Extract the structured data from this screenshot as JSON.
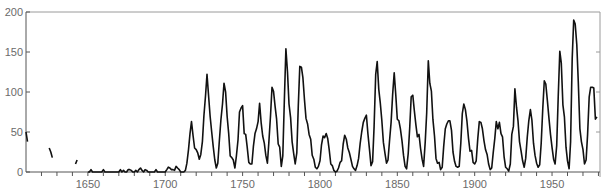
{
  "chart_data": {
    "type": "line",
    "title": "",
    "xlabel": "",
    "ylabel": "",
    "xlim": [
      1610,
      1981
    ],
    "ylim": [
      0,
      200
    ],
    "grid": false,
    "legend": null,
    "x_ticks": [
      1650,
      1700,
      1750,
      1800,
      1850,
      1900,
      1950
    ],
    "y_ticks": [
      0,
      50,
      100,
      150,
      200
    ],
    "series": [
      {
        "name": "Annual sunspot number",
        "segments": [
          {
            "x": [
              1610,
              1611
            ],
            "values": [
              50,
              38
            ]
          },
          {
            "x": [
              1625,
              1626,
              1627
            ],
            "values": [
              30,
              25,
              18
            ]
          },
          {
            "x": [
              1642,
              1643
            ],
            "values": [
              10,
              15
            ]
          },
          {
            "x": [
              1650,
              1651,
              1652,
              1653,
              1654,
              1655,
              1656,
              1657,
              1658,
              1659,
              1660,
              1661,
              1662,
              1663,
              1664,
              1665,
              1666,
              1667,
              1668,
              1669,
              1670,
              1671,
              1672,
              1673,
              1674,
              1675,
              1676,
              1677,
              1678,
              1679,
              1680,
              1681,
              1682,
              1683,
              1684,
              1685,
              1686,
              1687,
              1688,
              1689,
              1690,
              1691,
              1692,
              1693,
              1694,
              1695,
              1696,
              1697,
              1698,
              1699,
              1700,
              1701,
              1702,
              1703,
              1704,
              1705,
              1706,
              1707,
              1708,
              1709,
              1710,
              1711,
              1712,
              1713,
              1714,
              1715,
              1716,
              1717,
              1718,
              1719,
              1720,
              1721,
              1722,
              1723,
              1724,
              1725,
              1726,
              1727,
              1728,
              1729,
              1730,
              1731,
              1732,
              1733,
              1734,
              1735,
              1736,
              1737,
              1738,
              1739,
              1740,
              1741,
              1742,
              1743,
              1744,
              1745,
              1746,
              1747,
              1748,
              1749,
              1750,
              1751,
              1752,
              1753,
              1754,
              1755,
              1756,
              1757,
              1758,
              1759,
              1760,
              1761,
              1762,
              1763,
              1764,
              1765,
              1766,
              1767,
              1768,
              1769,
              1770,
              1771,
              1772,
              1773,
              1774,
              1775,
              1776,
              1777,
              1778,
              1779,
              1780,
              1781,
              1782,
              1783,
              1784,
              1785,
              1786,
              1787,
              1788,
              1789,
              1790,
              1791,
              1792,
              1793,
              1794,
              1795,
              1796,
              1797,
              1798,
              1799,
              1800,
              1801,
              1802,
              1803,
              1804,
              1805,
              1806,
              1807,
              1808,
              1809,
              1810,
              1811,
              1812,
              1813,
              1814,
              1815,
              1816,
              1817,
              1818,
              1819,
              1820,
              1821,
              1822,
              1823,
              1824,
              1825,
              1826,
              1827,
              1828,
              1829,
              1830,
              1831,
              1832,
              1833,
              1834,
              1835,
              1836,
              1837,
              1838,
              1839,
              1840,
              1841,
              1842,
              1843,
              1844,
              1845,
              1846,
              1847,
              1848,
              1849,
              1850,
              1851,
              1852,
              1853,
              1854,
              1855,
              1856,
              1857,
              1858,
              1859,
              1860,
              1861,
              1862,
              1863,
              1864,
              1865,
              1866,
              1867,
              1868,
              1869,
              1870,
              1871,
              1872,
              1873,
              1874,
              1875,
              1876,
              1877,
              1878,
              1879,
              1880,
              1881,
              1882,
              1883,
              1884,
              1885,
              1886,
              1887,
              1888,
              1889,
              1890,
              1891,
              1892,
              1893,
              1894,
              1895,
              1896,
              1897,
              1898,
              1899,
              1900,
              1901,
              1902,
              1903,
              1904,
              1905,
              1906,
              1907,
              1908,
              1909,
              1910,
              1911,
              1912,
              1913,
              1914,
              1915,
              1916,
              1917,
              1918,
              1919,
              1920,
              1921,
              1922,
              1923,
              1924,
              1925,
              1926,
              1927,
              1928,
              1929,
              1930,
              1931,
              1932,
              1933,
              1934,
              1935,
              1936,
              1937,
              1938,
              1939,
              1940,
              1941,
              1942,
              1943,
              1944,
              1945,
              1946,
              1947,
              1948,
              1949,
              1950,
              1951,
              1952,
              1953,
              1954,
              1955,
              1956,
              1957,
              1958,
              1959,
              1960,
              1961,
              1962,
              1963,
              1964,
              1965,
              1966,
              1967,
              1968,
              1969,
              1970,
              1971,
              1972,
              1973,
              1974,
              1975,
              1976,
              1977,
              1978,
              1979
            ],
            "values": [
              0,
              0,
              3,
              0,
              0,
              0,
              0,
              0,
              0,
              0,
              3,
              0,
              0,
              0,
              0,
              0,
              0,
              0,
              0,
              0,
              0,
              3,
              0,
              2,
              0,
              0,
              3,
              3,
              2,
              0,
              0,
              2,
              0,
              3,
              5,
              2,
              0,
              3,
              2,
              0,
              0,
              0,
              0,
              0,
              3,
              0,
              0,
              0,
              0,
              0,
              0,
              3,
              6,
              5,
              3,
              3,
              2,
              7,
              5,
              3,
              0,
              0,
              0,
              2,
              11,
              28,
              48,
              63,
              45,
              30,
              28,
              24,
              16,
              22,
              38,
              70,
              95,
              122,
              95,
              70,
              50,
              32,
              15,
              5,
              11,
              40,
              65,
              85,
              111,
              100,
              70,
              48,
              20,
              18,
              15,
              5,
              20,
              40,
              75,
              80,
              83,
              48,
              47,
              31,
              12,
              10,
              10,
              32,
              48,
              54,
              63,
              86,
              61,
              45,
              36,
              21,
              11,
              38,
              70,
              106,
              101,
              82,
              66,
              35,
              31,
              7,
              20,
              92,
              154,
              125,
              85,
              68,
              38,
              23,
              10,
              24,
              83,
              132,
              131,
              118,
              90,
              67,
              60,
              47,
              41,
              21,
              16,
              6,
              4,
              7,
              14,
              34,
              45,
              43,
              48,
              42,
              28,
              10,
              8,
              2,
              0,
              1,
              5,
              12,
              14,
              35,
              46,
              41,
              30,
              24,
              16,
              7,
              4,
              2,
              8,
              17,
              36,
              50,
              62,
              67,
              71,
              48,
              28,
              8,
              13,
              57,
              122,
              138,
              103,
              86,
              65,
              37,
              24,
              11,
              15,
              40,
              62,
              98,
              124,
              96,
              66,
              64,
              54,
              39,
              21,
              7,
              4,
              23,
              55,
              94,
              96,
              77,
              59,
              44,
              47,
              30,
              16,
              7,
              37,
              74,
              139,
              111,
              101,
              66,
              45,
              17,
              11,
              12,
              3,
              6,
              32,
              54,
              60,
              64,
              64,
              52,
              25,
              13,
              7,
              6,
              7,
              36,
              73,
              85,
              78,
              64,
              42,
              26,
              27,
              12,
              10,
              14,
              42,
              63,
              62,
              54,
              39,
              28,
              22,
              10,
              3,
              5,
              24,
              42,
              63,
              54,
              62,
              48,
              44,
              19,
              6,
              4,
              1,
              10,
              47,
              57,
              104,
              81,
              64,
              38,
              26,
              14,
              6,
              17,
              44,
              64,
              78,
              65,
              36,
              21,
              11,
              6,
              9,
              36,
              80,
              114,
              110,
              89,
              68,
              47,
              31,
              16,
              10,
              33,
              93,
              151,
              136,
              84,
              69,
              31,
              14,
              4,
              38,
              142,
              190,
              185,
              159,
              112,
              54,
              38,
              28,
              10,
              15,
              47,
              94,
              106,
              106,
              105,
              66,
              69,
              38,
              35,
              34
            ]
          }
        ]
      }
    ]
  }
}
